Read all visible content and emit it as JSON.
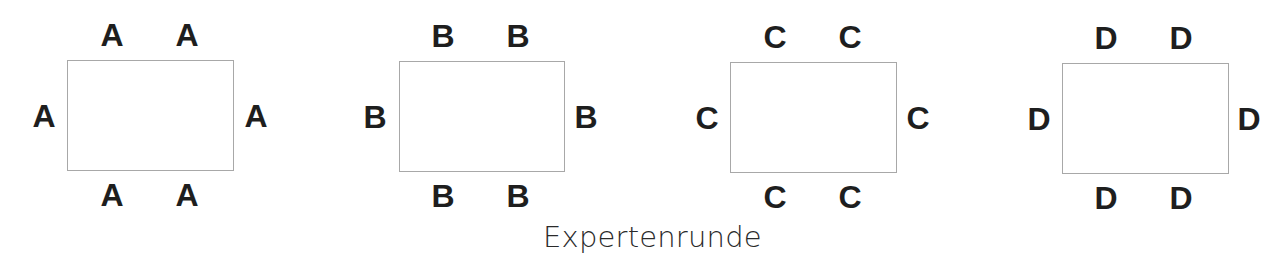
{
  "caption": "Expertenrunde",
  "groups": [
    {
      "label": "A",
      "rect": {
        "x": 67,
        "y": 60,
        "w": 167,
        "h": 111
      },
      "seats": {
        "top": [
          112,
          187
        ],
        "left": 44,
        "right": 256
      }
    },
    {
      "label": "B",
      "rect": {
        "x": 399,
        "y": 61,
        "w": 166,
        "h": 111
      },
      "seats": {
        "top": [
          443,
          518
        ],
        "left": 375,
        "right": 586
      }
    },
    {
      "label": "C",
      "rect": {
        "x": 730,
        "y": 62,
        "w": 167,
        "h": 111
      },
      "seats": {
        "top": [
          775,
          850
        ],
        "left": 707,
        "right": 918
      }
    },
    {
      "label": "D",
      "rect": {
        "x": 1062,
        "y": 63,
        "w": 167,
        "h": 111
      },
      "seats": {
        "top": [
          1106,
          1181
        ],
        "left": 1039,
        "right": 1249
      }
    }
  ]
}
